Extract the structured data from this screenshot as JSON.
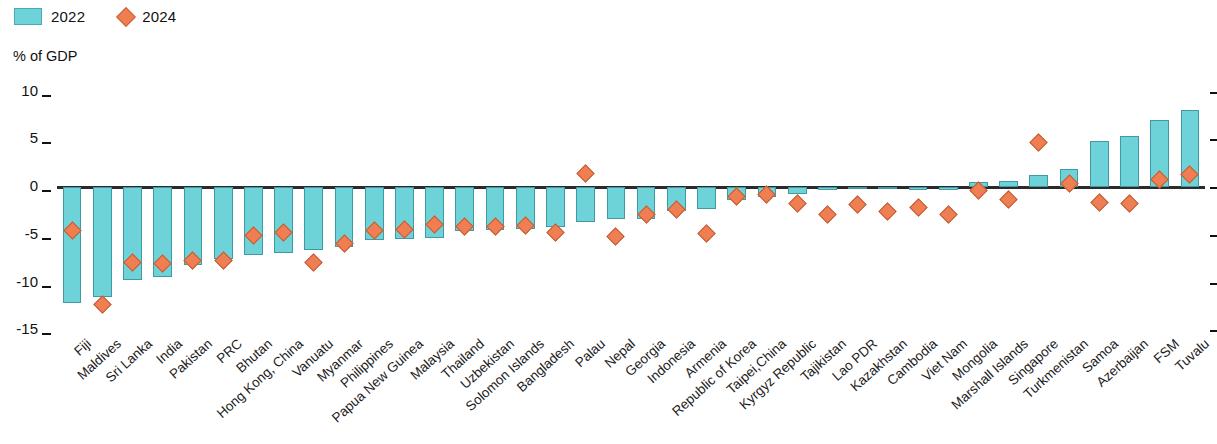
{
  "legend": {
    "items": [
      {
        "label": "2022",
        "marker": "bar-swatch",
        "color": "#6ed3d8"
      },
      {
        "label": "2024",
        "marker": "diamond",
        "color": "#ef7f53"
      }
    ]
  },
  "axis_title": "% of GDP",
  "chart_data": {
    "type": "bar",
    "title": "",
    "subtitle": "",
    "xlabel": "",
    "ylabel": "% of GDP",
    "ylim": [
      -15,
      10
    ],
    "yticks": [
      10,
      5,
      0,
      -5,
      -10,
      -15
    ],
    "grid": false,
    "legend_position": "top-left",
    "zero_line": 0,
    "categories": [
      "Fiji",
      "Maldives",
      "Sri Lanka",
      "India",
      "Pakistan",
      "PRC",
      "Bhutan",
      "Hong Kong, China",
      "Vanuatu",
      "Myanmar",
      "Philippines",
      "Papua New Guinea",
      "Malaysia",
      "Thailand",
      "Uzbekistan",
      "Solomon Islands",
      "Bangladesh",
      "Palau",
      "Nepal",
      "Georgia",
      "Indonesia",
      "Armenia",
      "Republic of Korea",
      "Taipei,China",
      "Kyrgyz Republic",
      "Tajikistan",
      "Lao PDR",
      "Kazakhstan",
      "Cambodia",
      "Viet Nam",
      "Mongolia",
      "Marshall Islands",
      "Singapore",
      "Turkmenistan",
      "Samoa",
      "Azerbaijan",
      "FSM",
      "Tuvalu"
    ],
    "series": [
      {
        "name": "2022",
        "type": "bar",
        "color": "#6ed3d8",
        "values": [
          -12.1,
          -11.5,
          -9.7,
          -9.4,
          -8.2,
          -7.5,
          -7.1,
          -6.9,
          -6.6,
          -6.3,
          -5.6,
          -5.4,
          -5.3,
          -4.6,
          -4.5,
          -4.4,
          -4.2,
          -3.7,
          -3.4,
          -3.3,
          -2.5,
          -2.3,
          -1.4,
          -1.0,
          -0.7,
          -0.3,
          -0.2,
          -0.2,
          -0.3,
          -0.3,
          0.5,
          0.6,
          1.3,
          1.9,
          4.8,
          5.3,
          7.0,
          8.1
        ]
      },
      {
        "name": "2024",
        "type": "scatter",
        "color": "#ef7f53",
        "values": [
          -4.6,
          -12.3,
          -7.9,
          -8.0,
          -7.7,
          -7.7,
          -5.1,
          -4.8,
          -7.9,
          -5.9,
          -4.6,
          -4.5,
          -3.9,
          -4.1,
          -4.1,
          -4.0,
          -4.8,
          1.4,
          -5.2,
          -2.9,
          -2.4,
          -4.9,
          -1.0,
          -0.8,
          -1.7,
          -2.9,
          -1.8,
          -2.6,
          -2.1,
          -2.9,
          -0.4,
          -1.3,
          4.7,
          0.4,
          -1.6,
          -1.7,
          0.8,
          1.3
        ]
      }
    ]
  }
}
